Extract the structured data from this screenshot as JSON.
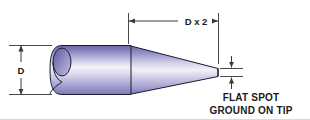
{
  "diagram": {
    "type": "engineering-dimension-drawing",
    "background_color": "#ffffff",
    "dimensions": {
      "diameter": {
        "label": "D",
        "orientation": "vertical",
        "position": "left",
        "arrow_style": "double-ended-inward"
      },
      "taper_length": {
        "label": "D x 2",
        "orientation": "horizontal",
        "position": "top",
        "arrow_style": "double-ended-inward"
      },
      "flat_spot": {
        "label": "",
        "orientation": "vertical",
        "position": "right-tip",
        "arrow_style": "double-ended-inward"
      }
    },
    "notes": [
      {
        "line": "FLAT SPOT"
      },
      {
        "line": "GROUND ON TIP"
      }
    ],
    "part": {
      "shape": "cylinder-with-conical-tapered-tip",
      "end_face": "angled-elliptical-cut",
      "tip": "flat-ground",
      "surface_colors": {
        "edge_dark": "#6f6aa8",
        "mid_light": "#f2f1f9",
        "body_mid": "#9a95c9",
        "outline": "#1b1b2e"
      }
    }
  }
}
